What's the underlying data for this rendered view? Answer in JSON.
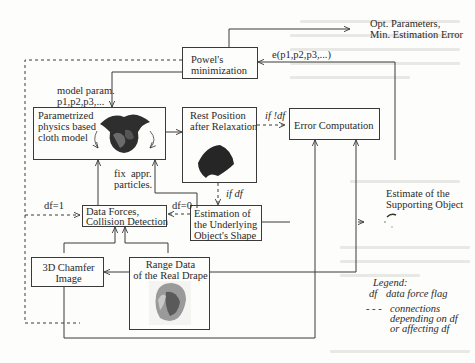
{
  "diagram": {
    "nodes": {
      "powell": {
        "line1": "Powel's",
        "line2": "minimization"
      },
      "cloth_model": {
        "line1": "Parametrized",
        "line2": "physics based",
        "line3": "cloth model"
      },
      "rest_position": {
        "line1": "Rest Position",
        "line2": "after Relaxation"
      },
      "error": {
        "label": "Error Computation"
      },
      "data_forces": {
        "line1": "Data Forces,",
        "line2": "Collision Detection"
      },
      "estimation": {
        "line1": "Estimation of",
        "line2": "the Underlying",
        "line3": "Object's Shape"
      },
      "chamfer": {
        "line1": "3D Chamfer",
        "line2": "Image"
      },
      "range_data": {
        "line1": "Range Data",
        "line2": "of the Real Drape"
      }
    },
    "annotations": {
      "output_line1": "Opt. Parameters,",
      "output_line2": "Min. Estimation Error",
      "error_fn": "e(p1,p2,p3,...)",
      "model_param_line1": "model param.",
      "model_param_line2": "p1,p2,p3,...",
      "fix_line1": "fix  appr.",
      "fix_line2": "particles.",
      "if_not_df": "if !df",
      "if_df": "if df",
      "df1": "df=1",
      "df0": "df=0",
      "supporting_line1": "Estimate of the",
      "supporting_line2": "Supporting Object"
    },
    "legend": {
      "title": "Legend:",
      "df_key": "df",
      "df_desc": "data force flag",
      "dash_key": "- - -",
      "dash_line1": "connections",
      "dash_line2": "depending on df",
      "dash_line3": "or affecting df"
    },
    "colors": {
      "line": "#3a3a3a",
      "background": "#fdfdfb",
      "cloth": "#2e2e2e"
    }
  }
}
